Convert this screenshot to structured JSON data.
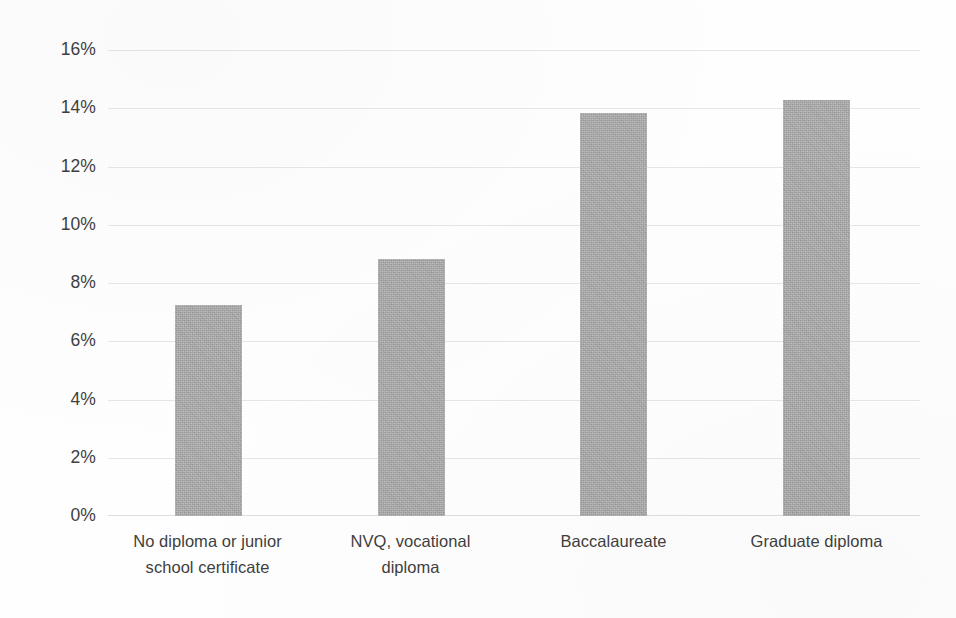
{
  "chart_data": {
    "type": "bar",
    "title": "",
    "subtitle": "",
    "xlabel": "",
    "ylabel": "",
    "legend": [],
    "legend_position": "none",
    "grid": true,
    "grid_axis": "y",
    "ylim": [
      0,
      16
    ],
    "y_tick_step": 2,
    "y_tick_labels": [
      "16%",
      "14%",
      "12%",
      "10%",
      "8%",
      "6%",
      "4%",
      "2%",
      "0%"
    ],
    "y_tick_values": [
      16,
      14,
      12,
      10,
      8,
      6,
      4,
      2,
      0
    ],
    "value_format": "percent",
    "categories": [
      "No diploma or junior school certificate",
      "NVQ, vocational diploma",
      "Baccalaureate",
      "Graduate diploma"
    ],
    "category_lines": [
      [
        "No diploma or junior",
        "school certificate"
      ],
      [
        "NVQ, vocational",
        "diploma"
      ],
      [
        "Baccalaureate"
      ],
      [
        "Graduate diploma"
      ]
    ],
    "values": [
      7.25,
      8.85,
      13.85,
      14.3
    ],
    "series": [
      {
        "name": "",
        "values": [
          7.25,
          8.85,
          13.85,
          14.3
        ]
      }
    ],
    "colors": {
      "bar": "#a8a8a8",
      "gridline": "#e2e2e2",
      "baseline": "#d8d8d8",
      "text": "#3f3f3f",
      "background": "#ffffff"
    }
  }
}
